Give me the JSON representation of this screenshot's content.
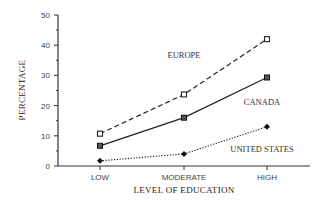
{
  "chart_data": {
    "type": "line",
    "title": "",
    "xlabel": "LEVEL OF EDUCATION",
    "ylabel": "PERCENTAGE",
    "categories": [
      "LOW",
      "MODERATE",
      "HIGH"
    ],
    "yticks": [
      0,
      10,
      20,
      30,
      40,
      50
    ],
    "ylim": [
      0,
      50
    ],
    "grid": false,
    "legend": "inline labels",
    "series": [
      {
        "name": "EUROPE",
        "values": [
          10.7,
          23.7,
          42
        ],
        "style": "dashed",
        "marker": "open-square"
      },
      {
        "name": "CANADA",
        "values": [
          6.7,
          16,
          29.3
        ],
        "style": "solid",
        "marker": "filled-square"
      },
      {
        "name": "UNITED STATES",
        "values": [
          1.7,
          4,
          13
        ],
        "style": "dotted",
        "marker": "diamond"
      }
    ]
  }
}
